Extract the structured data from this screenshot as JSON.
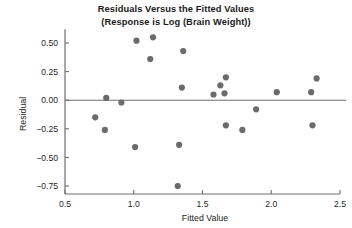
{
  "chart_data": {
    "type": "scatter",
    "title": "Residuals Versus the Fitted Values",
    "subtitle": "(Response is Log (Brain Weight))",
    "xlabel": "Fitted Value",
    "ylabel": "Residual",
    "xlim": [
      0.5,
      2.5
    ],
    "ylim": [
      -0.85,
      0.65
    ],
    "xticks": [
      0.5,
      1.0,
      1.5,
      2.0,
      2.5
    ],
    "xticklabels": [
      "0.5",
      "1.0",
      "1.5",
      "2.0",
      "2.5"
    ],
    "yticks": [
      0.5,
      0.25,
      0.0,
      -0.25,
      -0.5,
      -0.75
    ],
    "yticklabels": [
      "0.50",
      "0.25",
      "0.00",
      "-0.25",
      "-0.50",
      "-0.75"
    ],
    "grid": false,
    "legend": null,
    "reference_line": {
      "axis": "y",
      "value": 0.0,
      "color": "#6e6e6e"
    },
    "marker": {
      "shape": "circle",
      "color": "#6b6b6b",
      "size": 3.1
    },
    "x": [
      0.72,
      0.79,
      0.8,
      0.91,
      1.01,
      1.02,
      1.12,
      1.14,
      1.32,
      1.33,
      1.35,
      1.36,
      1.58,
      1.63,
      1.66,
      1.67,
      1.67,
      1.79,
      1.89,
      2.04,
      2.29,
      2.3,
      2.33,
      2.34
    ],
    "y": [
      -0.15,
      -0.26,
      0.02,
      -0.02,
      -0.41,
      0.52,
      0.36,
      0.55,
      -0.75,
      -0.39,
      0.11,
      0.43,
      0.05,
      0.13,
      0.06,
      0.2,
      -0.22,
      -0.26,
      -0.08,
      0.07,
      0.07,
      -0.22,
      0.19,
      0.19
    ],
    "points": [
      {
        "x": 0.72,
        "y": -0.15
      },
      {
        "x": 0.79,
        "y": -0.26
      },
      {
        "x": 0.8,
        "y": 0.02
      },
      {
        "x": 0.91,
        "y": -0.02
      },
      {
        "x": 1.01,
        "y": -0.41
      },
      {
        "x": 1.02,
        "y": 0.52
      },
      {
        "x": 1.12,
        "y": 0.36
      },
      {
        "x": 1.14,
        "y": 0.55
      },
      {
        "x": 1.32,
        "y": -0.75
      },
      {
        "x": 1.33,
        "y": -0.39
      },
      {
        "x": 1.35,
        "y": 0.11
      },
      {
        "x": 1.36,
        "y": 0.43
      },
      {
        "x": 1.58,
        "y": 0.05
      },
      {
        "x": 1.63,
        "y": 0.13
      },
      {
        "x": 1.66,
        "y": 0.06
      },
      {
        "x": 1.67,
        "y": 0.2
      },
      {
        "x": 1.67,
        "y": -0.22
      },
      {
        "x": 1.79,
        "y": -0.26
      },
      {
        "x": 1.89,
        "y": -0.08
      },
      {
        "x": 2.04,
        "y": 0.07
      },
      {
        "x": 2.29,
        "y": 0.07
      },
      {
        "x": 2.3,
        "y": -0.22
      },
      {
        "x": 2.33,
        "y": 0.19
      }
    ]
  }
}
